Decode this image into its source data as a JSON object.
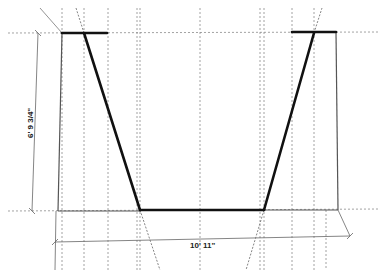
{
  "diagram": {
    "type": "technical-sketch",
    "colors": {
      "background": "#ffffff",
      "bold_line": "#111111",
      "thin_line": "#555555",
      "guide_line": "#8a8a8a"
    },
    "dimensions": {
      "height_label": "6' 9 3/4\"",
      "width_label": "10' 11\""
    },
    "guides": {
      "vertical_x": [
        62,
        84,
        108,
        137,
        200,
        260,
        292,
        314
      ],
      "horizontal_y": [
        33,
        210
      ]
    },
    "shape": {
      "top_y": 33,
      "bottom_y": 210,
      "left_edge_x": 62,
      "right_edge_x": 336,
      "trapezoid": {
        "top_left": [
          84,
          33
        ],
        "top_right": [
          314,
          33
        ],
        "bottom_left": [
          140,
          210
        ],
        "bottom_right": [
          264,
          210
        ]
      }
    }
  }
}
